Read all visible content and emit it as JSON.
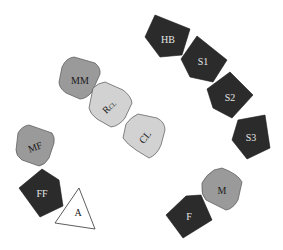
{
  "diagram": {
    "title": "",
    "colors": {
      "dark": "#2b2b2b",
      "medium": "#9a9a9a",
      "light": "#d2d2d2",
      "white": "#ffffff",
      "stroke": "#555555"
    },
    "nodes": [
      {
        "id": "HB",
        "label": "HB",
        "shade": "dark"
      },
      {
        "id": "S1",
        "label": "S1",
        "shade": "dark"
      },
      {
        "id": "S2",
        "label": "S2",
        "shade": "dark"
      },
      {
        "id": "S3",
        "label": "S3",
        "shade": "dark"
      },
      {
        "id": "MM",
        "label": "MM",
        "shade": "medium"
      },
      {
        "id": "RCL",
        "label": "R",
        "subscript": "CL",
        "shade": "light"
      },
      {
        "id": "CL",
        "label": "CL",
        "shade": "light"
      },
      {
        "id": "MF",
        "label": "MF",
        "shade": "medium"
      },
      {
        "id": "FF",
        "label": "FF",
        "shade": "dark"
      },
      {
        "id": "A",
        "label": "A",
        "shade": "white",
        "shape": "triangle"
      },
      {
        "id": "M",
        "label": "M",
        "shade": "medium"
      },
      {
        "id": "F",
        "label": "F",
        "shade": "dark"
      }
    ]
  }
}
